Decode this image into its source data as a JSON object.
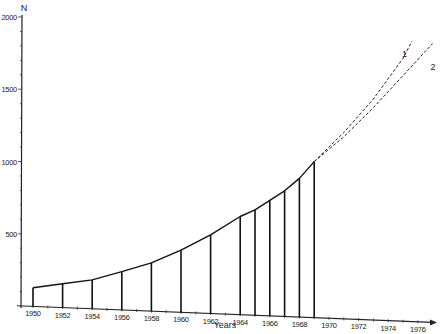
{
  "chart_data": {
    "type": "line",
    "title": "",
    "xlabel": "Years",
    "ylabel": "N",
    "ylim": [
      0,
      2000
    ],
    "xlim": [
      1950,
      1977
    ],
    "grid": false,
    "y_ticks": [
      500,
      1000,
      1500,
      2000
    ],
    "y_tick_labels": [
      "500",
      "1000",
      "1500",
      "2000"
    ],
    "x_ticks": [
      1950,
      1952,
      1954,
      1956,
      1958,
      1960,
      1962,
      1964,
      1966,
      1968,
      1970,
      1972,
      1974,
      1976
    ],
    "x_tick_labels": [
      "1950",
      "1952",
      "1954",
      "1956",
      "1958",
      "1960",
      "1962",
      "1964",
      "1966",
      "1968",
      "1970",
      "1972",
      "1974",
      "1976"
    ],
    "series": [
      {
        "name": "observed",
        "style": "solid line with vertical drop lines",
        "x": [
          1950,
          1952,
          1954,
          1956,
          1958,
          1960,
          1962,
          1964,
          1965,
          1966,
          1967,
          1968,
          1969
        ],
        "values": [
          130,
          165,
          200,
          265,
          335,
          430,
          545,
          680,
          730,
          800,
          870,
          960,
          1080
        ]
      },
      {
        "name": "1",
        "style": "dashed extrapolation",
        "x": [
          1969,
          1971,
          1973,
          1975,
          1975.6
        ],
        "values": [
          1080,
          1290,
          1530,
          1820,
          1940
        ]
      },
      {
        "name": "2",
        "style": "dashed extrapolation",
        "x": [
          1969,
          1971,
          1973,
          1975,
          1977
        ],
        "values": [
          1080,
          1260,
          1470,
          1700,
          1930
        ]
      }
    ],
    "legend": {
      "position": "inline near line ends",
      "entries": [
        "1",
        "2"
      ]
    }
  }
}
